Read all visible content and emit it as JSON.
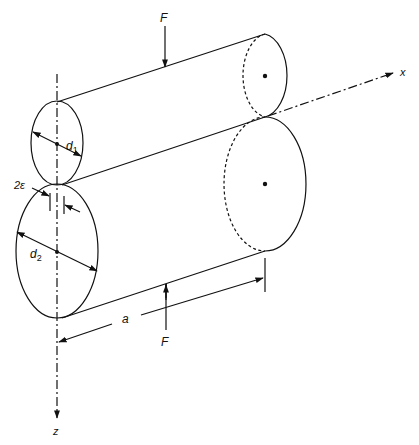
{
  "figure": {
    "labels": {
      "force_top": "F",
      "force_bottom": "F",
      "diameter_small": "d",
      "diameter_small_sub": "1",
      "diameter_large": "d",
      "diameter_large_sub": "2",
      "contact_width": "2ε",
      "length": "a",
      "axis_x": "x",
      "axis_z": "z"
    },
    "colors": {
      "line": "#111111",
      "background": "#ffffff"
    }
  }
}
